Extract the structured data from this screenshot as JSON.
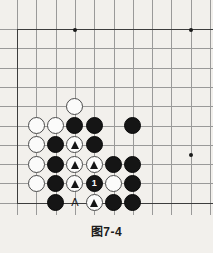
{
  "caption": "图7-4",
  "board": {
    "name": "go-board-diagram",
    "background_color": "#f2f0ec",
    "line_color": "#9a9a99",
    "edge_color": "#3d3d3d",
    "black_color": "#151515",
    "white_color": "#fbfbfa",
    "spacing": 19.3,
    "origin_x": 17,
    "origin_y": 29,
    "cols": 10,
    "rows": 10,
    "edges": {
      "left": true,
      "bottom": true,
      "top": true
    },
    "star_points": [
      {
        "col": 3,
        "row": 0
      },
      {
        "col": 9,
        "row": 0
      },
      {
        "col": 9,
        "row": 6.5
      }
    ],
    "stones": [
      {
        "col": 3,
        "row": 4,
        "color": "white",
        "mark": "none"
      },
      {
        "col": 1,
        "row": 5,
        "color": "white",
        "mark": "none"
      },
      {
        "col": 2,
        "row": 5,
        "color": "white",
        "mark": "none"
      },
      {
        "col": 3,
        "row": 5,
        "color": "black",
        "mark": "none"
      },
      {
        "col": 4,
        "row": 5,
        "color": "black",
        "mark": "none"
      },
      {
        "col": 6,
        "row": 5,
        "color": "black",
        "mark": "none"
      },
      {
        "col": 1,
        "row": 6,
        "color": "white",
        "mark": "none"
      },
      {
        "col": 2,
        "row": 6,
        "color": "black",
        "mark": "none"
      },
      {
        "col": 3,
        "row": 6,
        "color": "white",
        "mark": "triangle"
      },
      {
        "col": 4,
        "row": 6,
        "color": "black",
        "mark": "none"
      },
      {
        "col": 1,
        "row": 7,
        "color": "white",
        "mark": "none"
      },
      {
        "col": 2,
        "row": 7,
        "color": "black",
        "mark": "none"
      },
      {
        "col": 3,
        "row": 7,
        "color": "white",
        "mark": "triangle"
      },
      {
        "col": 4,
        "row": 7,
        "color": "white",
        "mark": "triangle"
      },
      {
        "col": 5,
        "row": 7,
        "color": "black",
        "mark": "none"
      },
      {
        "col": 6,
        "row": 7,
        "color": "black",
        "mark": "none"
      },
      {
        "col": 1,
        "row": 8,
        "color": "white",
        "mark": "none"
      },
      {
        "col": 2,
        "row": 8,
        "color": "black",
        "mark": "none"
      },
      {
        "col": 3,
        "row": 8,
        "color": "white",
        "mark": "triangle"
      },
      {
        "col": 4,
        "row": 8,
        "color": "black",
        "mark": "number",
        "number": "1"
      },
      {
        "col": 5,
        "row": 8,
        "color": "white",
        "mark": "none"
      },
      {
        "col": 6,
        "row": 8,
        "color": "black",
        "mark": "none"
      },
      {
        "col": 2,
        "row": 9,
        "color": "black",
        "mark": "none"
      },
      {
        "col": 4,
        "row": 9,
        "color": "white",
        "mark": "triangle"
      },
      {
        "col": 5,
        "row": 9,
        "color": "black",
        "mark": "none"
      },
      {
        "col": 6,
        "row": 9,
        "color": "black",
        "mark": "none"
      }
    ],
    "point_labels": [
      {
        "col": 3,
        "row": 9,
        "text": "A"
      }
    ]
  }
}
